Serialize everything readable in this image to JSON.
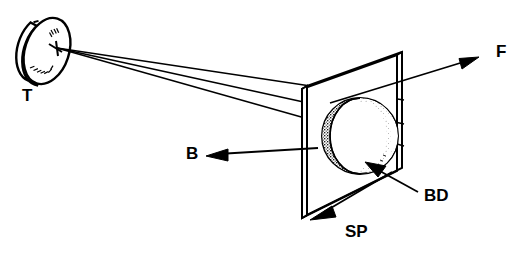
{
  "figure": {
    "type": "technical-line-diagram",
    "background_color": "#ffffff",
    "line_color": "#000000"
  },
  "labels": {
    "target": "T",
    "backward": "B",
    "forward": "F",
    "beam_dump": "BD",
    "sample_plane": "SP"
  },
  "components": {
    "target_disc": {
      "name": "T",
      "shape": "tilted-disc",
      "center_x": 47,
      "center_y": 51,
      "rx": 22,
      "ry": 34,
      "rotation_deg": 18,
      "thickness": 9,
      "hatched": true
    },
    "sample_plate": {
      "name": "SP",
      "shape": "parallelogram-plate",
      "thickness": 6,
      "front_face": [
        [
          307,
          86
        ],
        [
          307,
          215
        ],
        [
          402,
          168
        ],
        [
          402,
          52
        ]
      ],
      "note": "thin transparent plate in perspective"
    },
    "beam_dump_sphere": {
      "name": "BD",
      "shape": "shaded-sphere",
      "center_x": 360,
      "center_y": 136,
      "radius": 38,
      "shading": "stippled crescent on left, light interior"
    }
  },
  "rays": {
    "source_point": {
      "x": 57,
      "y": 48
    },
    "count": 3,
    "endpoints": [
      {
        "x": 404,
        "y": 100
      },
      {
        "x": 404,
        "y": 124
      },
      {
        "x": 404,
        "y": 146
      }
    ]
  },
  "arrows": {
    "forward": {
      "label": "F",
      "from": {
        "x": 330,
        "y": 103
      },
      "to": {
        "x": 478,
        "y": 58
      },
      "direction": "up-right"
    },
    "backward": {
      "label": "B",
      "from": {
        "x": 318,
        "y": 148
      },
      "to": {
        "x": 208,
        "y": 155
      },
      "direction": "left"
    },
    "beam_dump": {
      "label": "BD",
      "from": {
        "x": 418,
        "y": 192
      },
      "to": {
        "x": 366,
        "y": 163
      },
      "direction": "up-left"
    },
    "sample_plane": {
      "label": "SP",
      "from": {
        "x": 390,
        "y": 172
      },
      "to": {
        "x": 312,
        "y": 219
      },
      "direction": "down-left"
    }
  },
  "label_positions": {
    "target": {
      "x": 22,
      "y": 97
    },
    "backward": {
      "x": 186,
      "y": 155
    },
    "forward": {
      "x": 496,
      "y": 53
    },
    "beam_dump": {
      "x": 424,
      "y": 197
    },
    "sample_plane": {
      "x": 345,
      "y": 233
    }
  }
}
